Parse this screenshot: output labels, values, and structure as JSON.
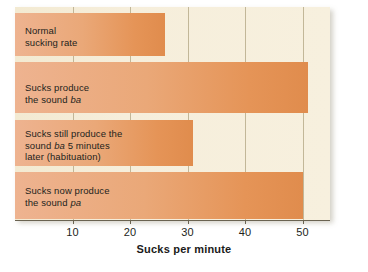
{
  "chart_data": {
    "type": "bar",
    "orientation": "horizontal",
    "title": "",
    "xlabel": "Sucks per minute",
    "ylabel": "",
    "xlim": [
      0,
      55
    ],
    "grid": true,
    "legend": "none",
    "xticks": [
      10,
      20,
      30,
      40,
      50
    ],
    "xtick_labels": [
      "10",
      "20",
      "30",
      "40",
      "50"
    ],
    "categories": [
      "Normal sucking rate",
      "Sucks produce the sound ba",
      "Sucks still produce the sound ba 5 minutes later (habituation)",
      "Sucks now produce the sound pa"
    ],
    "values": [
      26,
      51,
      31,
      50
    ],
    "bars": [
      {
        "label_lines": [
          "Normal",
          "sucking rate"
        ],
        "italic_word": "",
        "value": 26
      },
      {
        "label_lines": [
          "Sucks produce",
          "the sound ba"
        ],
        "italic_word": "ba",
        "value": 51
      },
      {
        "label_lines": [
          "Sucks still produce the",
          "sound ba 5 minutes",
          "later (habituation)"
        ],
        "italic_word": "ba",
        "value": 31
      },
      {
        "label_lines": [
          "Sucks now produce",
          "the sound pa"
        ],
        "italic_word": "pa",
        "value": 50
      }
    ],
    "colors": {
      "bar_light": "#eeb390",
      "bar_dark": "#e08c4d",
      "panel_background": "#f6eedb",
      "gridline": "#b9ad8c",
      "axis": "#6a6351",
      "text": "#231f1c"
    }
  }
}
